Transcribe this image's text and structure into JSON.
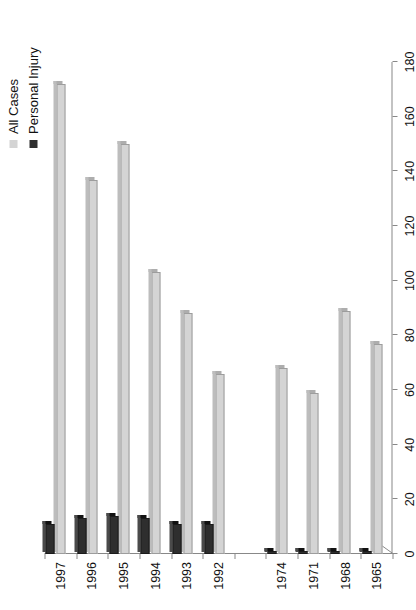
{
  "legend": {
    "position": "top-right",
    "items": [
      {
        "label": "All Cases",
        "color": "#d4d4d4",
        "icon": "legend-square-icon"
      },
      {
        "label": "Personal Injury",
        "color": "#2e2e2e",
        "icon": "legend-square-icon"
      }
    ]
  },
  "chart_data": {
    "type": "bar",
    "orientation": "horizontal",
    "title": "",
    "subtitle": "",
    "xlabel": "",
    "ylabel": "",
    "grid": false,
    "legend_position": "top-right",
    "note": "Category axis has a scale break between 1974 and 1992 (no bars drawn in the gap).",
    "categories": [
      "1965",
      "1968",
      "1971",
      "1974",
      "1992",
      "1993",
      "1994",
      "1995",
      "1996",
      "1997"
    ],
    "value_axis": {
      "min": 0,
      "max": 180,
      "ticks": [
        0,
        20,
        40,
        60,
        80,
        100,
        120,
        140,
        160,
        180
      ],
      "tick_labels": [
        "0",
        "20",
        "40",
        "60",
        "80",
        "100",
        "120",
        "140",
        "160",
        "180"
      ]
    },
    "series": [
      {
        "name": "All Cases",
        "color": "#d4d4d4",
        "values": [
          77,
          89,
          59,
          68,
          66,
          88,
          103,
          150,
          137,
          172
        ]
      },
      {
        "name": "Personal Injury",
        "color": "#2e2e2e",
        "values": [
          1,
          1,
          1,
          1,
          11,
          11,
          13,
          14,
          13,
          11
        ]
      }
    ]
  }
}
